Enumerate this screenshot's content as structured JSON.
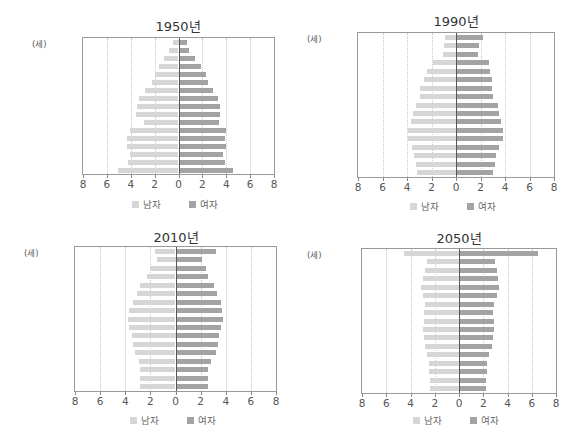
{
  "chart_data": [
    {
      "type": "bar",
      "subtype": "population-pyramid",
      "title": "1950년",
      "unit_label": "(세)",
      "categories": [
        "80 이상",
        "75-79",
        "70-74",
        "65-69",
        "60-64",
        "55-59",
        "50-54",
        "45-49",
        "40-44",
        "35-39",
        "30-34",
        "25-29",
        "20-24",
        "15-19",
        "10-14",
        "5-9",
        "0-4"
      ],
      "series": [
        {
          "name": "남자",
          "side": "left",
          "values": [
            0.5,
            0.8,
            1.2,
            1.6,
            2.0,
            2.2,
            2.8,
            3.3,
            3.5,
            3.6,
            2.9,
            4.1,
            4.3,
            4.3,
            4.1,
            4.2,
            5.1
          ]
        },
        {
          "name": "여자",
          "side": "right",
          "values": [
            0.7,
            0.9,
            1.4,
            1.9,
            2.3,
            2.5,
            2.9,
            3.3,
            3.5,
            3.5,
            3.4,
            4.0,
            3.9,
            4.0,
            3.7,
            3.9,
            4.6
          ]
        }
      ],
      "xticks": [
        "8",
        "6",
        "4",
        "2",
        "0",
        "2",
        "4",
        "6",
        "8"
      ],
      "xlim": [
        -8,
        8
      ],
      "legend": [
        "남자",
        "여자"
      ],
      "legend_position": "bottom",
      "grid": true
    },
    {
      "type": "bar",
      "subtype": "population-pyramid",
      "title": "1990년",
      "unit_label": "(세)",
      "categories": [
        "80 이상",
        "75-79",
        "70-74",
        "65-69",
        "60-64",
        "55-59",
        "50-54",
        "45-49",
        "40-44",
        "35-39",
        "30-34",
        "25-29",
        "20-24",
        "15-19",
        "10-14",
        "5-9",
        "0-4"
      ],
      "series": [
        {
          "name": "남자",
          "side": "left",
          "values": [
            0.9,
            1.0,
            1.1,
            1.9,
            2.4,
            2.6,
            2.9,
            2.9,
            3.3,
            3.5,
            3.7,
            3.9,
            3.9,
            3.6,
            3.4,
            3.3,
            3.2
          ]
        },
        {
          "name": "여자",
          "side": "right",
          "values": [
            2.2,
            1.9,
            1.8,
            2.7,
            2.8,
            2.9,
            2.9,
            3.0,
            3.4,
            3.5,
            3.7,
            3.8,
            3.8,
            3.5,
            3.3,
            3.2,
            3.0
          ]
        }
      ],
      "xticks": [
        "8",
        "6",
        "4",
        "2",
        "0",
        "2",
        "4",
        "6",
        "8"
      ],
      "xlim": [
        -8,
        8
      ],
      "legend": [
        "남자",
        "여자"
      ],
      "legend_position": "bottom",
      "grid": true
    },
    {
      "type": "bar",
      "subtype": "population-pyramid",
      "title": "2010년",
      "unit_label": "(세)",
      "categories": [
        "80 이상",
        "75-79",
        "70-74",
        "65-69",
        "60-64",
        "55-59",
        "50-54",
        "45-49",
        "40-44",
        "35-39",
        "30-34",
        "25-29",
        "20-24",
        "15-19",
        "10-14",
        "5-9",
        "0-4"
      ],
      "series": [
        {
          "name": "남자",
          "side": "left",
          "values": [
            1.6,
            1.5,
            2.0,
            2.3,
            2.8,
            3.1,
            3.4,
            3.7,
            3.8,
            3.7,
            3.5,
            3.4,
            3.2,
            2.9,
            2.8,
            2.8,
            2.8
          ]
        },
        {
          "name": "여자",
          "side": "right",
          "values": [
            3.2,
            2.1,
            2.4,
            2.6,
            3.1,
            3.3,
            3.6,
            3.7,
            3.8,
            3.6,
            3.5,
            3.4,
            3.2,
            2.8,
            2.6,
            2.6,
            2.6
          ]
        }
      ],
      "xticks": [
        "8",
        "6",
        "4",
        "2",
        "0",
        "2",
        "4",
        "6",
        "8"
      ],
      "xlim": [
        -8,
        8
      ],
      "legend": [
        "남자",
        "여자"
      ],
      "legend_position": "bottom",
      "grid": true
    },
    {
      "type": "bar",
      "subtype": "population-pyramid",
      "title": "2050년",
      "unit_label": "(세)",
      "categories": [
        "80 이상",
        "75-79",
        "70-74",
        "65-69",
        "60-64",
        "55-59",
        "50-54",
        "45-49",
        "40-44",
        "35-39",
        "30-34",
        "25-29",
        "20-24",
        "15-19",
        "10-14",
        "5-9",
        "0-4"
      ],
      "series": [
        {
          "name": "남자",
          "side": "left",
          "values": [
            4.5,
            2.6,
            2.8,
            3.0,
            3.1,
            3.0,
            2.8,
            2.9,
            2.9,
            3.0,
            2.9,
            2.8,
            2.6,
            2.5,
            2.5,
            2.4,
            2.4
          ]
        },
        {
          "name": "여자",
          "side": "right",
          "values": [
            6.5,
            3.0,
            3.1,
            3.2,
            3.3,
            3.1,
            2.9,
            2.8,
            2.9,
            2.9,
            2.8,
            2.7,
            2.5,
            2.3,
            2.3,
            2.2,
            2.2
          ]
        }
      ],
      "xticks": [
        "8",
        "6",
        "4",
        "2",
        "0",
        "2",
        "4",
        "6",
        "8"
      ],
      "xlim": [
        -8,
        8
      ],
      "legend": [
        "남자",
        "여자"
      ],
      "legend_position": "bottom",
      "grid": true
    }
  ],
  "colors": {
    "male": "#d6d6d6",
    "female": "#a3a3a3",
    "frame": "#9a9a9a",
    "grid": "#c8c8c8",
    "axis": "#555555"
  },
  "layout": [
    {
      "frame": {
        "left": 82,
        "top": 37,
        "width": 193,
        "height": 138
      },
      "title_center": 178,
      "title_top": 16,
      "legend_top": 197,
      "unit_left": 32
    },
    {
      "frame": {
        "left": 357,
        "top": 32,
        "width": 198,
        "height": 146
      },
      "title_center": 456,
      "title_top": 11,
      "legend_top": 199,
      "unit_left": 307
    },
    {
      "frame": {
        "left": 74,
        "top": 246,
        "width": 203,
        "height": 146
      },
      "title_center": 176,
      "title_top": 227,
      "legend_top": 413,
      "unit_left": 24
    },
    {
      "frame": {
        "left": 361,
        "top": 248,
        "width": 196,
        "height": 146
      },
      "title_center": 459,
      "title_top": 228,
      "legend_top": 413,
      "unit_left": 307
    }
  ]
}
